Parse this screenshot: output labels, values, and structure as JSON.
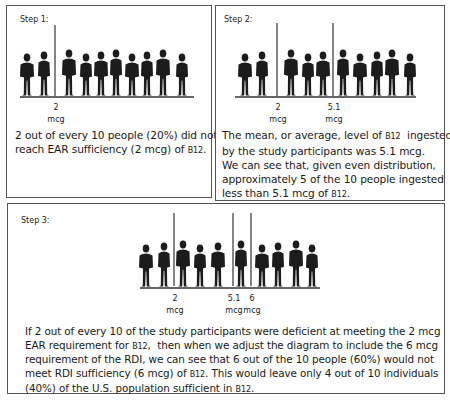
{
  "panels": [
    {
      "id": "step1",
      "label": "Step 1:",
      "ground": {
        "x1": 13,
        "x2": 187,
        "y": 91
      },
      "markers": [
        {
          "x": 48,
          "y1": 19,
          "y2": 90,
          "value": "2",
          "unit": "mcg"
        }
      ],
      "figures": [
        20,
        37,
        62,
        79,
        94,
        109,
        125,
        140,
        156,
        175
      ],
      "caption_lines": [
        {
          "text": "2 out of every 10 people (20%) did not",
          "sub": ""
        },
        {
          "text": "reach EAR sufficiency (2 mcg) of ",
          "sub": "B12",
          "after": "."
        }
      ]
    },
    {
      "id": "step2",
      "label": "Step 2:",
      "ground": {
        "x1": 19,
        "x2": 200,
        "y": 91
      },
      "markers": [
        {
          "x": 61,
          "y1": 17,
          "y2": 90,
          "value": "2",
          "unit": "mcg"
        },
        {
          "x": 117,
          "y1": 17,
          "y2": 90,
          "value": "5.1",
          "unit": "mcg"
        }
      ],
      "figures": [
        29,
        46,
        75,
        92,
        107,
        127,
        144,
        161,
        176,
        194
      ],
      "caption_lines": [
        {
          "text": "The mean, or average, level of ",
          "sub": "B12",
          "after": "  ingested"
        },
        {
          "text": "by the study participants was 5.1 mcg.",
          "sub": ""
        },
        {
          "text": "We can see that, given even distribution,",
          "sub": ""
        },
        {
          "text": "approximately 5 of the 10 people ingested",
          "sub": ""
        },
        {
          "text": "less than 5.1 mcg of ",
          "sub": "B12",
          "after": "."
        }
      ]
    },
    {
      "id": "step3",
      "label": "Step 3:",
      "ground": {
        "x1": 132,
        "x2": 312,
        "y": 84
      },
      "markers": [
        {
          "x": 166,
          "y1": 9,
          "y2": 82,
          "value": "2",
          "unit": "mcg"
        },
        {
          "x": 225,
          "y1": 9,
          "y2": 82,
          "value": "5.1",
          "unit": "mcg"
        },
        {
          "x": 243,
          "y1": 9,
          "y2": 82,
          "value": "6",
          "unit": "mcg"
        }
      ],
      "figures": [
        138,
        156,
        175,
        192,
        210,
        233,
        254,
        270,
        288,
        304
      ],
      "caption_lines": [
        {
          "text": "If 2 out of every 10 of the study participants were deficient at meeting the 2 mcg",
          "sub": ""
        },
        {
          "text": "EAR requirement for ",
          "sub": "B12",
          "after": ",  then when we adjust the diagram to include the 6 mcg"
        },
        {
          "text": "requirement of the RDI, we can see that 6 out of the 10 people (60%) would not",
          "sub": ""
        },
        {
          "text": "meet RDI sufficiency (6 mcg) of ",
          "sub": "B12",
          "after": ". This would leave only 4 out of 10 individuals"
        },
        {
          "text": "(40%) of the U.S. population sufficient in ",
          "sub": "B12",
          "after": "."
        }
      ]
    }
  ],
  "colors": {
    "silhouette": "#1c1c1c",
    "line": "#333333",
    "border": "#555555"
  }
}
